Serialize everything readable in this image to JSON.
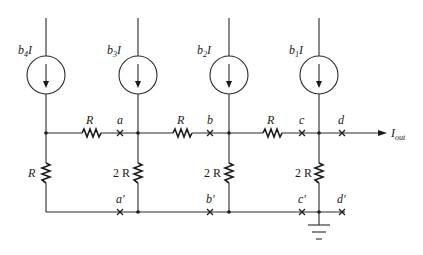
{
  "diagram": {
    "type": "R-2R ladder DAC (current-source driven)",
    "current_sources": [
      {
        "id": "b4",
        "label": "b",
        "subscript": "4",
        "suffix": "I",
        "x": 46
      },
      {
        "id": "b3",
        "label": "b",
        "subscript": "3",
        "suffix": "I",
        "x": 138
      },
      {
        "id": "b2",
        "label": "b",
        "subscript": "2",
        "suffix": "I",
        "x": 229
      },
      {
        "id": "b1",
        "label": "b",
        "subscript": "1",
        "suffix": "I",
        "x": 320
      }
    ],
    "series_resistors": [
      {
        "label": "R",
        "between": "left-node to a"
      },
      {
        "label": "R",
        "between": "a-junction to b"
      },
      {
        "label": "R",
        "between": "b-junction to c"
      }
    ],
    "shunt_resistors": [
      {
        "label": "R",
        "position": "left"
      },
      {
        "label": "2R",
        "position": "a"
      },
      {
        "label": "2R",
        "position": "b"
      },
      {
        "label": "2R",
        "position": "c"
      }
    ],
    "nodes_top": [
      "a",
      "b",
      "c",
      "d"
    ],
    "nodes_bottom": [
      "a′",
      "b′",
      "c′",
      "d′"
    ],
    "output": {
      "label": "I",
      "subscript": "out"
    },
    "ground": "ground-symbol"
  },
  "labels": {
    "b4I": {
      "main": "b",
      "sub": "4",
      "tail": "I"
    },
    "b3I": {
      "main": "b",
      "sub": "3",
      "tail": "I"
    },
    "b2I": {
      "main": "b",
      "sub": "2",
      "tail": "I"
    },
    "b1I": {
      "main": "b",
      "sub": "1",
      "tail": "I"
    },
    "r_series_1": "R",
    "r_series_2": "R",
    "r_series_3": "R",
    "r_shunt_left": "R",
    "r_shunt_a": "2 R",
    "r_shunt_b": "2 R",
    "r_shunt_c": "2 R",
    "node_a": "a",
    "node_b": "b",
    "node_c": "c",
    "node_d": "d",
    "node_a_prime": "a′",
    "node_b_prime": "b′",
    "node_c_prime": "c′",
    "node_d_prime": "d′",
    "iout_main": "I",
    "iout_sub": "out"
  }
}
